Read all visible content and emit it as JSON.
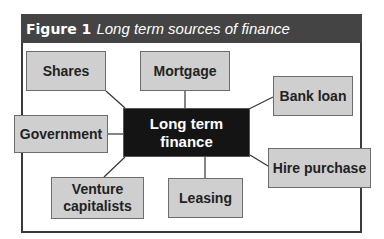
{
  "figure": {
    "number": "Figure 1",
    "title": "Long term sources of finance"
  },
  "center": {
    "label_line1": "Long term",
    "label_line2": "finance"
  },
  "sources": {
    "shares": "Shares",
    "mortgage": "Mortgage",
    "bank_loan": "Bank loan",
    "government": "Government",
    "hire_purchase": "Hire purchase",
    "venture_line1": "Venture",
    "venture_line2": "capitalists",
    "leasing": "Leasing"
  },
  "colors": {
    "header_bg": "#444444",
    "center_bg": "#141414",
    "box_bg": "#cfcfcf",
    "box_border": "#6d6d6d"
  }
}
